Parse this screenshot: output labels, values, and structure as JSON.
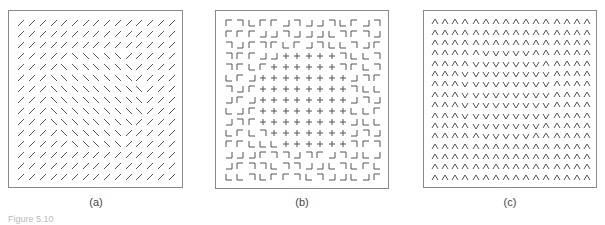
{
  "figure": {
    "caption": "Figure 5.10",
    "panels": [
      {
        "id": "a",
        "label": "(a)",
        "element_type": "line-segments",
        "rows": 15,
        "cols": 15,
        "legend": {
          "/": "forward-slash",
          "\\": "back-slash"
        },
        "grid": [
          "///////////////",
          "///////////////",
          "///////////////",
          "/////\\\\\\\\\\////",
          "////\\\\\\\\\\\\\\///",
          "///\\\\\\\\\\\\\\\\///",
          "///\\\\\\\\\\\\\\\\\\//",
          "///\\\\\\\\\\\\\\\\\\//",
          "///\\\\\\\\\\\\\\\\\\//",
          "///\\\\\\\\\\\\\\\\///",
          "////\\\\\\\\\\\\////",
          "/////\\\\\\\\\\/////",
          "///////////////",
          "///////////////",
          "///////////////"
        ]
      },
      {
        "id": "b",
        "label": "(b)",
        "element_type": "L-junctions-and-crosses",
        "rows": 15,
        "cols": 14,
        "legend": {
          "A": "corner-top-left",
          "B": "corner-top-right",
          "C": "corner-bottom-left",
          "D": "corner-bottom-right",
          "+": "cross"
        },
        "grid": [
          "ABCAADBDDBCADB",
          "AAADDBDDDCBABD",
          "BDABACADBCCBDA",
          "BAADD+++++BCCB",
          "BACA++++++BACB",
          "CAD++++++++DBA",
          "BDA++++++++BCC",
          "DAD++++++++DBD",
          "CDA++++++++CCA",
          "DBA++++++++DCC",
          "CACB+++++++DBD",
          "AACCC++++++BAB",
          "DDDABBDBADBDCD",
          "DABBCBBDDCBCAC",
          "CCBCAABCBDDCDA"
        ]
      },
      {
        "id": "c",
        "label": "(c)",
        "element_type": "chevrons",
        "rows": 16,
        "cols": 16,
        "legend": {
          "^": "caret-up",
          "v": "vee-down"
        },
        "grid": [
          "^^^^^^^^^^^^^^^^",
          "^^^^^^^^^^^^^^^^",
          "^^^^^^^^^^^^^^^^",
          "^^^^^vvvvv^^^^^^",
          "^^^^vvvvvvv^^^^^",
          "^^^vvvvvvvvv^^^^",
          "^^^vvvvvvvvv^^^^",
          "^^^vvvvvvvvv^^^^",
          "^^^vvvvvvvvv^^^^",
          "^^^vvvvvvvvv^^^^",
          "^^^^vvvvvvv^^^^^",
          "^^^^^vvvvv^^^^^^",
          "^^^^^^^^^^^^^^^^",
          "^^^^^^^^^^^^^^^^",
          "^^^^^^^^^^^^^^^^",
          "^^^^^^^^^^^^^^^^"
        ]
      }
    ]
  },
  "colors": {
    "stroke": "#555555",
    "border": "#8a8a8a",
    "label": "#444444"
  }
}
